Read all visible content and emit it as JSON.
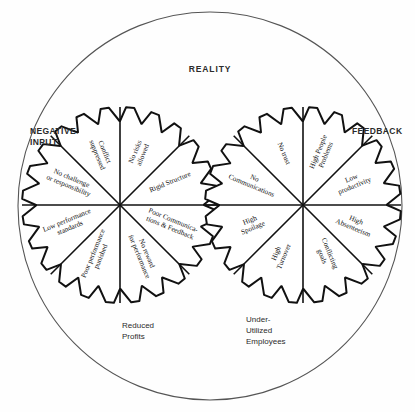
{
  "diagram": {
    "title": "REALITY",
    "outer_circle": {
      "label": "REALITY",
      "stroke": "#555555"
    },
    "side_labels": {
      "left": "NEGATIVE\nINPUT",
      "right": "FEEDBACK"
    },
    "captions": [
      {
        "name": "reduced-profits",
        "text": "Reduced\nProfits"
      },
      {
        "name": "under-utilized-employees",
        "text": "Under-\nUtilized\nEmployees"
      }
    ],
    "gears": [
      {
        "name": "left-gear",
        "caption": "Reduced Profits",
        "teeth": 24,
        "segments": [
          {
            "index": 0,
            "label": "No risks\nallowed"
          },
          {
            "index": 1,
            "label": "Rigid Structure"
          },
          {
            "index": 2,
            "label": "Poor Communica-\ntions & Feedback"
          },
          {
            "index": 3,
            "label": "No reward\nfor performance"
          },
          {
            "index": 4,
            "label": "Poor performance\npunished"
          },
          {
            "index": 5,
            "label": "Low performance\nstandards"
          },
          {
            "index": 6,
            "label": "No challenge\nor responsibility"
          },
          {
            "index": 7,
            "label": "Conflict\nsuppressed"
          }
        ]
      },
      {
        "name": "right-gear",
        "caption": "Under-Utilized Employees",
        "teeth": 24,
        "segments": [
          {
            "index": 0,
            "label": "High People\nProblems"
          },
          {
            "index": 1,
            "label": "Low\nproductivity"
          },
          {
            "index": 2,
            "label": "High\nAbsenteeism"
          },
          {
            "index": 3,
            "label": "Conflicting\ngoals"
          },
          {
            "index": 4,
            "label": "High\nTurnover"
          },
          {
            "index": 5,
            "label": "High\nSpoilage"
          },
          {
            "index": 6,
            "label": "No\nCommunications"
          },
          {
            "index": 7,
            "label": "No trust"
          }
        ]
      }
    ],
    "colors": {
      "ink": "#111111",
      "outer_stroke": "#555555",
      "background": "#ffffff"
    }
  }
}
